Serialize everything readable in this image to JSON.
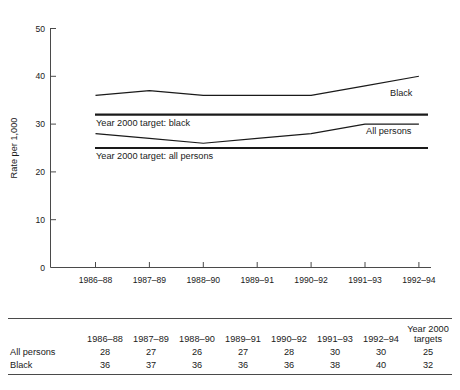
{
  "chart_data": {
    "type": "line",
    "title": "",
    "xlabel": "",
    "ylabel": "Rate per 1,000",
    "ylim": [
      0,
      50
    ],
    "yticks": [
      0,
      10,
      20,
      30,
      40,
      50
    ],
    "grid": false,
    "legend_position": "inline-right",
    "categories": [
      "1986–88",
      "1987–89",
      "1988–90",
      "1989–91",
      "1990–92",
      "1991–93",
      "1992–94"
    ],
    "series": [
      {
        "name": "Black",
        "values": [
          36,
          37,
          36,
          36,
          36,
          38,
          40
        ]
      },
      {
        "name": "All persons",
        "values": [
          28,
          27,
          26,
          27,
          28,
          30,
          30
        ]
      }
    ],
    "reference_lines": [
      {
        "name": "Year 2000 target: black",
        "value": 32
      },
      {
        "name": "Year 2000 target: all persons",
        "value": 25
      }
    ],
    "annotations": [
      "Black",
      "All persons",
      "Year 2000 target: black",
      "Year 2000 target: all persons"
    ]
  },
  "chart": {
    "y_axis_title": "Rate per 1,000",
    "y_tick_labels": [
      "50",
      "40",
      "30",
      "20",
      "10",
      "0"
    ],
    "x_tick_labels": [
      "1986–88",
      "1987–89",
      "1988–90",
      "1989–91",
      "1990–92",
      "1991–93",
      "1992–94"
    ],
    "series_labels": {
      "black": "Black",
      "all_persons": "All persons"
    },
    "target_labels": {
      "black": "Year 2000 target: black",
      "all_persons": "Year 2000 target: all persons"
    },
    "colors": {
      "line": "#1a1a1a",
      "axis": "#4a4a4a",
      "background": "#ffffff"
    }
  },
  "table": {
    "columns": [
      "1986–88",
      "1987–89",
      "1988–90",
      "1989–91",
      "1990–92",
      "1991–93",
      "1992–94"
    ],
    "target_column": {
      "line1": "Year 2000",
      "line2": "targets"
    },
    "rows": [
      {
        "label": "All persons",
        "values": [
          "28",
          "27",
          "26",
          "27",
          "28",
          "30",
          "30"
        ],
        "target": "25"
      },
      {
        "label": "Black",
        "values": [
          "36",
          "37",
          "36",
          "36",
          "36",
          "38",
          "40"
        ],
        "target": "32"
      }
    ]
  }
}
